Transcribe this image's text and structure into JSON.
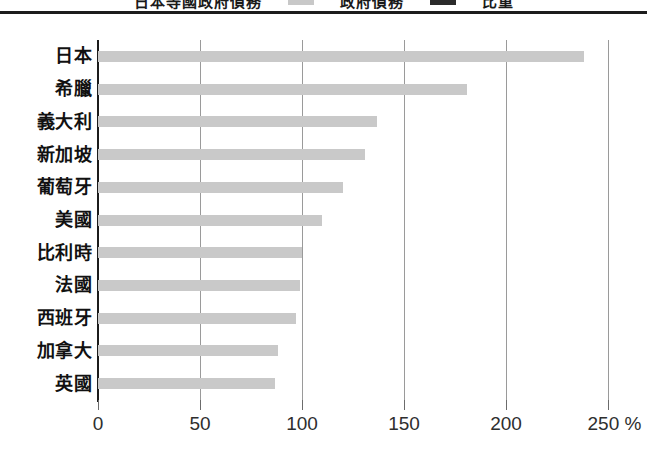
{
  "title_strip": {
    "fragment_left": "日本等國政府債務",
    "legend_label_1": "政府債務",
    "legend_label_2": "比重",
    "swatch_color_1": "#c8c8c8",
    "swatch_color_2": "#2b2b2b"
  },
  "chart_data": {
    "type": "bar",
    "orientation": "horizontal",
    "title": "",
    "xlabel": "%",
    "ylabel": "",
    "categories": [
      "日本",
      "希臘",
      "義大利",
      "新加坡",
      "葡萄牙",
      "美國",
      "比利時",
      "法國",
      "西班牙",
      "加拿大",
      "英國"
    ],
    "values": [
      238,
      181,
      137,
      131,
      120,
      110,
      100,
      99,
      97,
      88,
      87
    ],
    "xticks": [
      0,
      50,
      100,
      150,
      200,
      250
    ],
    "xtick_labels": [
      "0",
      "50",
      "100",
      "150",
      "200",
      "250 %"
    ],
    "xlim": [
      0,
      250
    ],
    "grid": true,
    "legend": "none",
    "bar_color": "#c9c9c9",
    "axis_color": "#1c1c1c",
    "grid_color": "#9a9a9a"
  }
}
